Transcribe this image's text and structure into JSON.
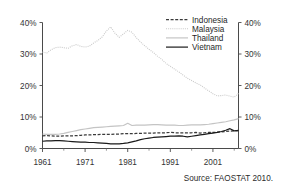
{
  "figure": {
    "source_note": "Source: FAOSTAT 2010."
  },
  "chart_data": {
    "type": "line",
    "title": "",
    "xlabel": "",
    "ylabel": "",
    "xlim": [
      1961,
      2007
    ],
    "ylim": [
      0,
      40
    ],
    "grid": false,
    "legend_position": "top-right",
    "y_tick_labels": [
      "0%",
      "10%",
      "20%",
      "30%",
      "40%"
    ],
    "y_ticks": [
      0,
      10,
      20,
      30,
      40
    ],
    "y_axis_right_labels": [
      "0%",
      "10%",
      "20%",
      "30%",
      "40%"
    ],
    "x_tick_labels": [
      "1961",
      "1971",
      "1981",
      "1991",
      "2001"
    ],
    "x_ticks": [
      1961,
      1971,
      1981,
      1991,
      2001
    ],
    "x_minor_ticks": [
      1966,
      1976,
      1986,
      1996,
      2006
    ],
    "x": [
      1961,
      1962,
      1963,
      1964,
      1965,
      1966,
      1967,
      1968,
      1969,
      1970,
      1971,
      1972,
      1973,
      1974,
      1975,
      1976,
      1977,
      1978,
      1979,
      1980,
      1981,
      1982,
      1983,
      1984,
      1985,
      1986,
      1987,
      1988,
      1989,
      1990,
      1991,
      1992,
      1993,
      1994,
      1995,
      1996,
      1997,
      1998,
      1999,
      2000,
      2001,
      2002,
      2003,
      2004,
      2005,
      2006,
      2007
    ],
    "series": [
      {
        "name": "Indonesia",
        "style": "dashed",
        "color": "#3a3a3a",
        "values": [
          4.0,
          4.1,
          4.0,
          3.9,
          3.9,
          4.0,
          4.0,
          4.0,
          4.1,
          4.2,
          4.3,
          4.3,
          4.4,
          4.4,
          4.5,
          4.5,
          4.5,
          4.6,
          4.6,
          4.7,
          4.7,
          4.7,
          4.8,
          4.8,
          4.9,
          4.9,
          4.9,
          5.0,
          5.0,
          5.0,
          5.1,
          5.0,
          5.0,
          5.0,
          5.0,
          5.0,
          5.1,
          4.9,
          5.0,
          5.1,
          5.1,
          5.2,
          5.3,
          5.4,
          5.5,
          5.6,
          5.6
        ]
      },
      {
        "name": "Malaysia",
        "style": "dotted",
        "color": "#c9c9c9",
        "values": [
          30.6,
          30.3,
          31.3,
          32.0,
          32.2,
          32.0,
          31.8,
          32.6,
          33.0,
          32.4,
          32.2,
          32.5,
          33.5,
          34.3,
          35.4,
          37.3,
          38.6,
          36.6,
          35.3,
          36.4,
          37.5,
          36.9,
          35.2,
          33.8,
          32.6,
          31.5,
          30.5,
          29.3,
          28.3,
          27.0,
          26.1,
          25.2,
          24.3,
          23.3,
          22.3,
          21.6,
          20.8,
          20.2,
          19.2,
          18.3,
          17.4,
          16.7,
          16.8,
          17.0,
          16.6,
          16.3,
          17.5
        ]
      },
      {
        "name": "Thailand",
        "style": "solid",
        "color": "#c4c4c4",
        "values": [
          4.6,
          4.5,
          4.5,
          4.5,
          4.6,
          4.8,
          5.1,
          5.4,
          5.7,
          6.0,
          6.2,
          6.4,
          6.6,
          6.7,
          6.8,
          6.9,
          7.0,
          7.1,
          7.2,
          7.3,
          8.0,
          7.3,
          7.4,
          7.4,
          7.4,
          7.5,
          7.6,
          7.6,
          7.5,
          7.4,
          7.4,
          7.4,
          7.3,
          7.3,
          7.4,
          7.5,
          7.5,
          7.5,
          7.6,
          7.7,
          7.9,
          8.1,
          8.3,
          8.5,
          8.8,
          9.1,
          9.5
        ]
      },
      {
        "name": "Vietnam",
        "style": "solid",
        "color": "#1a1a1a",
        "values": [
          2.3,
          2.4,
          2.4,
          2.5,
          2.5,
          2.4,
          2.3,
          2.2,
          2.1,
          2.0,
          2.0,
          1.9,
          1.9,
          1.8,
          1.7,
          1.6,
          1.5,
          1.5,
          1.5,
          1.6,
          1.8,
          2.1,
          2.4,
          2.8,
          3.1,
          3.3,
          3.5,
          3.6,
          3.7,
          3.8,
          3.9,
          3.9,
          4.0,
          3.9,
          3.7,
          3.9,
          4.1,
          4.3,
          4.5,
          4.7,
          4.9,
          5.1,
          5.4,
          5.8,
          6.3,
          5.6,
          5.8
        ]
      }
    ],
    "legend": [
      {
        "label": "Indonesia",
        "style": "dashed",
        "color": "#3a3a3a"
      },
      {
        "label": "Malaysia",
        "style": "dotted",
        "color": "#c9c9c9"
      },
      {
        "label": "Thailand",
        "style": "solid",
        "color": "#c4c4c4"
      },
      {
        "label": "Vietnam",
        "style": "solid",
        "color": "#1a1a1a"
      }
    ]
  }
}
